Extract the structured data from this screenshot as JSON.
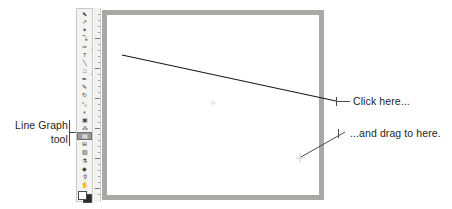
{
  "figure": {
    "kind": "software-tutorial-callout-figure",
    "application_area": "vector-illustration-artboard"
  },
  "annotations": [
    {
      "id": "line-graph-tool",
      "text_line_1": "Line Graph",
      "text_line_2": "tool",
      "side": "left"
    },
    {
      "id": "click-here",
      "text": "Click here...",
      "side": "right"
    },
    {
      "id": "drag-here",
      "text": "...and drag to here.",
      "side": "right"
    }
  ],
  "toolbar": {
    "name": "tools-palette",
    "selected_tool": "line-graph-tool",
    "background_color": "#f3f3f2",
    "selected_highlight_color": "#9a9a98",
    "tools": [
      {
        "name": "selection-tool",
        "glyph": "⬉"
      },
      {
        "name": "direct-selection-tool",
        "glyph": "↗"
      },
      {
        "name": "magic-wand-tool",
        "glyph": "✦"
      },
      {
        "name": "lasso-tool",
        "glyph": "⤵"
      },
      {
        "name": "pen-tool",
        "glyph": "✑"
      },
      {
        "name": "type-tool",
        "glyph": "T"
      },
      {
        "name": "line-segment-tool",
        "glyph": "╲"
      },
      {
        "name": "rectangle-tool",
        "glyph": "□"
      },
      {
        "name": "paintbrush-tool",
        "glyph": "✒"
      },
      {
        "name": "pencil-tool",
        "glyph": "✎"
      },
      {
        "name": "rotate-tool",
        "glyph": "↻"
      },
      {
        "name": "scale-tool",
        "glyph": "⤡"
      },
      {
        "name": "warp-tool",
        "glyph": "◐"
      },
      {
        "name": "free-transform-tool",
        "glyph": "▣"
      },
      {
        "name": "symbol-sprayer-tool",
        "glyph": "⁂"
      },
      {
        "name": "line-graph-tool",
        "glyph": "▤"
      },
      {
        "name": "mesh-tool",
        "glyph": "⊞"
      },
      {
        "name": "gradient-tool",
        "glyph": "▧"
      },
      {
        "name": "eyedropper-tool",
        "glyph": "⚗"
      },
      {
        "name": "blend-tool",
        "glyph": "◆"
      },
      {
        "name": "zoom-tool",
        "glyph": "⚲"
      },
      {
        "name": "hand-tool",
        "glyph": "✋"
      }
    ],
    "color_swatches": {
      "fill_color": "#ffffff",
      "stroke_color": "#2b2b2b"
    }
  },
  "document_window": {
    "name": "artboard-window",
    "frame_color": "#a8a8a6",
    "canvas_color": "#ffffff",
    "ruler": {
      "name": "vertical-ruler",
      "orientation": "vertical",
      "major_tick_count": 4
    }
  },
  "drawn_object": {
    "name": "graph-drag-line",
    "description": "diagonal line drawn from click point to drag point",
    "color": "#1a1a1a",
    "start_point": {
      "x": 122,
      "y": 55
    },
    "end_point": {
      "x": 336,
      "y": 101
    }
  },
  "markers": [
    {
      "name": "drag-target-crosshair",
      "x": 300,
      "y": 158,
      "color": "#bdbdbd"
    },
    {
      "name": "canvas-center-mark",
      "x": 213,
      "y": 103,
      "color": "#cccccc"
    }
  ],
  "leader_lines": {
    "color": "#4a4a4a",
    "click_here_leader": {
      "from": {
        "x": 336,
        "y": 101
      },
      "to": {
        "x": 350,
        "y": 101
      }
    },
    "drag_here_leader": {
      "from": {
        "x": 300,
        "y": 158
      },
      "to": {
        "x": 347,
        "y": 133
      }
    },
    "line_graph_tool_leader": {
      "from": {
        "x": 69,
        "y": 132
      },
      "to": {
        "x": 82,
        "y": 132
      }
    }
  }
}
